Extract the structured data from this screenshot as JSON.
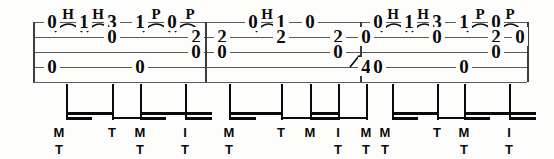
{
  "notation": {
    "type": "guitar-tablature",
    "staff": {
      "lines": 5,
      "top": 22,
      "bottom": 82,
      "left": 33,
      "right": 527,
      "line_color": "#5a5a5a"
    },
    "barlines": [
      205,
      360
    ],
    "measures": [
      {
        "index": 1,
        "notes": [
          {
            "x": 52,
            "string": 1,
            "fret": "0"
          },
          {
            "x": 52,
            "string": 4,
            "fret": "0"
          },
          {
            "x": 84,
            "string": 1,
            "fret": "1"
          },
          {
            "x": 112,
            "string": 1,
            "fret": "3"
          },
          {
            "x": 112,
            "string": 2,
            "fret": "0"
          },
          {
            "x": 140,
            "string": 1,
            "fret": "1"
          },
          {
            "x": 140,
            "string": 4,
            "fret": "0"
          },
          {
            "x": 172,
            "string": 1,
            "fret": "0"
          },
          {
            "x": 196,
            "string": 2,
            "fret": "2"
          },
          {
            "x": 196,
            "string": 3,
            "fret": "0"
          }
        ],
        "articulations": [
          {
            "x": 68,
            "label": "H"
          },
          {
            "x": 98,
            "label": "H"
          },
          {
            "x": 156,
            "label": "P"
          },
          {
            "x": 190,
            "label": "P"
          }
        ],
        "slurs": [
          {
            "x1": 55,
            "x2": 82
          },
          {
            "x1": 87,
            "x2": 112
          },
          {
            "x1": 143,
            "x2": 170
          },
          {
            "x1": 175,
            "x2": 200
          }
        ],
        "fingerings": [
          {
            "x": 59,
            "top": "M",
            "bottom": "T"
          },
          {
            "x": 112,
            "top": "T",
            "bottom": ""
          },
          {
            "x": 140,
            "top": "M",
            "bottom": "T"
          },
          {
            "x": 185,
            "top": "I",
            "bottom": "T"
          }
        ]
      },
      {
        "index": 2,
        "notes": [
          {
            "x": 222,
            "string": 2,
            "fret": "2"
          },
          {
            "x": 222,
            "string": 3,
            "fret": "0"
          },
          {
            "x": 253,
            "string": 1,
            "fret": "0"
          },
          {
            "x": 281,
            "string": 1,
            "fret": "1"
          },
          {
            "x": 281,
            "string": 2,
            "fret": "2"
          },
          {
            "x": 310,
            "string": 1,
            "fret": "0"
          },
          {
            "x": 338,
            "string": 2,
            "fret": "2"
          },
          {
            "x": 338,
            "string": 3,
            "fret": "0"
          },
          {
            "x": 366,
            "string": 2,
            "fret": "0"
          },
          {
            "x": 366,
            "string": 4,
            "fret": "4"
          }
        ],
        "articulations": [
          {
            "x": 267,
            "label": "H"
          }
        ],
        "slurs": [
          {
            "x1": 256,
            "x2": 281
          }
        ],
        "slides": [
          {
            "x1": 350,
            "x2": 368,
            "y": 68
          }
        ],
        "fingerings": [
          {
            "x": 229,
            "top": "M",
            "bottom": "T"
          },
          {
            "x": 281,
            "top": "T",
            "bottom": ""
          },
          {
            "x": 310,
            "top": "M",
            "bottom": ""
          },
          {
            "x": 338,
            "top": "I",
            "bottom": "T"
          },
          {
            "x": 366,
            "top": "M",
            "bottom": "T"
          }
        ]
      },
      {
        "index": 3,
        "notes": [
          {
            "x": 378,
            "string": 1,
            "fret": "0"
          },
          {
            "x": 378,
            "string": 4,
            "fret": "0"
          },
          {
            "x": 409,
            "string": 1,
            "fret": "1"
          },
          {
            "x": 437,
            "string": 1,
            "fret": "3"
          },
          {
            "x": 437,
            "string": 2,
            "fret": "0"
          },
          {
            "x": 464,
            "string": 1,
            "fret": "1"
          },
          {
            "x": 464,
            "string": 4,
            "fret": "0"
          },
          {
            "x": 496,
            "string": 1,
            "fret": "0"
          },
          {
            "x": 496,
            "string": 2,
            "fret": "2"
          },
          {
            "x": 496,
            "string": 3,
            "fret": "0"
          },
          {
            "x": 520,
            "string": 2,
            "fret": "0"
          }
        ],
        "articulations": [
          {
            "x": 393,
            "label": "H"
          },
          {
            "x": 423,
            "label": "H"
          },
          {
            "x": 480,
            "label": "P"
          },
          {
            "x": 510,
            "label": "P"
          }
        ],
        "slurs": [
          {
            "x1": 381,
            "x2": 407
          },
          {
            "x1": 412,
            "x2": 437
          },
          {
            "x1": 467,
            "x2": 494
          },
          {
            "x1": 498,
            "x2": 523
          }
        ],
        "fingerings": [
          {
            "x": 385,
            "top": "M",
            "bottom": "T"
          },
          {
            "x": 437,
            "top": "T",
            "bottom": ""
          },
          {
            "x": 464,
            "top": "M",
            "bottom": "T"
          },
          {
            "x": 509,
            "top": "I",
            "bottom": "T"
          }
        ]
      }
    ],
    "stems": [
      {
        "x": 66,
        "top": 84,
        "bottom": 120
      },
      {
        "x": 112,
        "top": 84,
        "bottom": 120
      },
      {
        "x": 140,
        "top": 84,
        "bottom": 120
      },
      {
        "x": 185,
        "top": 84,
        "bottom": 120
      },
      {
        "x": 140,
        "top": 84,
        "bottom": 120
      },
      {
        "x": 229,
        "top": 84,
        "bottom": 120
      },
      {
        "x": 281,
        "top": 84,
        "bottom": 120
      },
      {
        "x": 310,
        "top": 84,
        "bottom": 120
      },
      {
        "x": 338,
        "top": 84,
        "bottom": 120
      },
      {
        "x": 366,
        "top": 84,
        "bottom": 120
      },
      {
        "x": 392,
        "top": 84,
        "bottom": 120
      },
      {
        "x": 437,
        "top": 84,
        "bottom": 120
      },
      {
        "x": 464,
        "top": 84,
        "bottom": 120
      },
      {
        "x": 509,
        "top": 84,
        "bottom": 120
      }
    ],
    "beams": [
      {
        "x1": 66,
        "x2": 112,
        "y": 112,
        "h": 3
      },
      {
        "x1": 66,
        "x2": 92,
        "y": 117,
        "h": 3
      },
      {
        "x1": 112,
        "x2": 140,
        "y": 117,
        "h": 2
      },
      {
        "x1": 140,
        "x2": 185,
        "y": 112,
        "h": 3
      },
      {
        "x1": 140,
        "x2": 166,
        "y": 117,
        "h": 3
      },
      {
        "x1": 185,
        "x2": 212,
        "y": 112,
        "h": 3
      },
      {
        "x1": 185,
        "x2": 212,
        "y": 117,
        "h": 3
      },
      {
        "x1": 229,
        "x2": 281,
        "y": 112,
        "h": 3
      },
      {
        "x1": 229,
        "x2": 256,
        "y": 117,
        "h": 3
      },
      {
        "x1": 281,
        "x2": 310,
        "y": 117,
        "h": 2
      },
      {
        "x1": 310,
        "x2": 338,
        "y": 112,
        "h": 3
      },
      {
        "x1": 310,
        "x2": 338,
        "y": 117,
        "h": 3
      },
      {
        "x1": 338,
        "x2": 366,
        "y": 117,
        "h": 2
      },
      {
        "x1": 392,
        "x2": 437,
        "y": 112,
        "h": 3
      },
      {
        "x1": 392,
        "x2": 418,
        "y": 117,
        "h": 3
      },
      {
        "x1": 437,
        "x2": 464,
        "y": 117,
        "h": 2
      },
      {
        "x1": 464,
        "x2": 509,
        "y": 112,
        "h": 3
      },
      {
        "x1": 464,
        "x2": 490,
        "y": 117,
        "h": 3
      },
      {
        "x1": 509,
        "x2": 536,
        "y": 112,
        "h": 3
      },
      {
        "x1": 509,
        "x2": 536,
        "y": 117,
        "h": 3
      }
    ]
  }
}
